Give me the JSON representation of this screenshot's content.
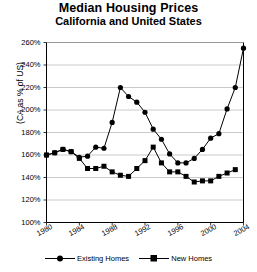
{
  "chart": {
    "title": "Median Housing Prices",
    "subtitle": "California and United States"
  },
  "axes": {
    "ylabel": "(CA as % of US)",
    "yticks": [
      "100%",
      "120%",
      "140%",
      "160%",
      "180%",
      "200%",
      "220%",
      "240%",
      "260%"
    ],
    "xticks": [
      "1980",
      "1984",
      "1988",
      "1992",
      "1996",
      "2000",
      "2004"
    ]
  },
  "legend": {
    "items": [
      {
        "label": "Existing Homes",
        "marker": "circle-marker-icon",
        "color": "#000000"
      },
      {
        "label": "New Homes",
        "marker": "square-marker-icon",
        "color": "#000000"
      }
    ]
  },
  "chart_data": {
    "type": "line",
    "title": "Median Housing Prices",
    "subtitle": "California and United States",
    "xlabel": "",
    "ylabel": "(CA as % of US)",
    "xlim": [
      1980,
      2004
    ],
    "ylim": [
      100,
      260
    ],
    "ytick_step": 20,
    "xtick_step": 4,
    "grid": "horizontal",
    "legend_position": "bottom",
    "x": [
      1980,
      1981,
      1982,
      1983,
      1984,
      1985,
      1986,
      1987,
      1988,
      1989,
      1990,
      1991,
      1992,
      1993,
      1994,
      1995,
      1996,
      1997,
      1998,
      1999,
      2000,
      2001,
      2002,
      2003
    ],
    "series": [
      {
        "name": "Existing Homes",
        "marker": "circle",
        "color": "#000000",
        "values": [
          160,
          162,
          165,
          163,
          158,
          159,
          167,
          166,
          189,
          220,
          212,
          207,
          198,
          183,
          174,
          161,
          153,
          153,
          157,
          165,
          175,
          179,
          201,
          220
        ]
      },
      {
        "name": "New Homes",
        "marker": "square",
        "color": "#000000",
        "values": [
          160,
          162,
          165,
          163,
          157,
          148,
          148,
          150,
          145,
          142,
          141,
          148,
          155,
          167,
          153,
          145,
          145,
          141,
          136,
          137,
          137,
          141,
          144,
          147
        ]
      }
    ],
    "final_point": {
      "x": 2004,
      "existing_homes": 255
    }
  }
}
